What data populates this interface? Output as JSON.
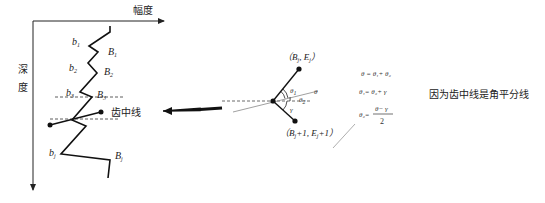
{
  "left_diagram": {
    "x_axis_label": "幅度",
    "y_axis_label_1": "深",
    "y_axis_label_2": "度",
    "labels_b": [
      {
        "base": "b",
        "sub": "1"
      },
      {
        "base": "b",
        "sub": "2"
      },
      {
        "base": "b",
        "sub": "3"
      },
      {
        "base": "b",
        "sub": "j"
      }
    ],
    "labels_B": [
      {
        "base": "B",
        "sub": "1"
      },
      {
        "base": "B",
        "sub": "2"
      },
      {
        "base": "B",
        "sub": "3"
      },
      {
        "base": "B",
        "sub": "j"
      }
    ],
    "midline_label": "齿中线"
  },
  "right_diagram": {
    "top_point_label": "（B",
    "top_point_sub": "j",
    "top_point_mid": ", E",
    "top_point_sub2": "j",
    "top_point_end": "）",
    "bottom_point_label": "（B",
    "bottom_point_sub": "j",
    "bottom_point_mid": "+1, E",
    "bottom_point_sub2": "j",
    "bottom_point_end": "+1）",
    "angle_theta1": "θ",
    "angle_theta1_sub": "1",
    "angle_theta2": "θ",
    "angle_theta2_sub": "2",
    "angle_theta": "θ",
    "angle_gamma": "γ"
  },
  "formulas": {
    "f1": "θ = θ₁+ θ₂",
    "f2": "θ₁= θ₂+ γ",
    "f3_lhs": "θ₂=",
    "f3_num": "θ− γ",
    "f3_den": "2"
  },
  "note": "因为齿中线是角平分线"
}
